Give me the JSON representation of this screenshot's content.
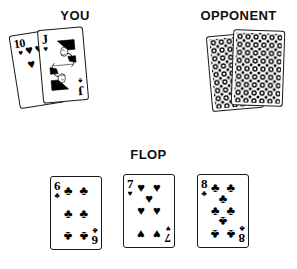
{
  "sections": {
    "you": {
      "heading": "YOU",
      "cards": [
        {
          "rank": "10",
          "suit": "hearts",
          "suit_glyph": "♥",
          "type": "number"
        },
        {
          "rank": "J",
          "suit": "spades",
          "suit_glyph": "♠",
          "type": "face"
        }
      ]
    },
    "opponent": {
      "heading": "OPPONENT",
      "cards": [
        {
          "face_down": true,
          "back_pattern": "dot-floral-lattice"
        },
        {
          "face_down": true,
          "back_pattern": "dot-floral-lattice"
        }
      ]
    },
    "flop": {
      "heading": "FLOP",
      "cards": [
        {
          "rank": "6",
          "suit": "clubs",
          "suit_glyph": "♣",
          "type": "number",
          "pip_count": 6
        },
        {
          "rank": "7",
          "suit": "hearts",
          "suit_glyph": "♥",
          "type": "number",
          "pip_count": 7
        },
        {
          "rank": "8",
          "suit": "clubs",
          "suit_glyph": "♣",
          "type": "number",
          "pip_count": 8
        }
      ]
    }
  },
  "colors": {
    "background": "#ffffff",
    "ink": "#000000",
    "card_border": "#1a1a1a"
  }
}
